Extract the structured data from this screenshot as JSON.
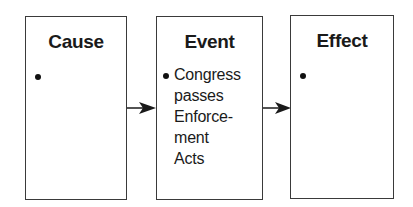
{
  "diagram": {
    "type": "cause-effect-chain",
    "boxes": [
      {
        "title": "Cause",
        "bullets": [
          ""
        ]
      },
      {
        "title": "Event",
        "bullets": [
          "Congress passes Enforce- ment Acts"
        ],
        "lines": [
          "Congress",
          "passes",
          "Enforce-",
          "ment",
          "Acts"
        ]
      },
      {
        "title": "Effect",
        "bullets": [
          ""
        ]
      }
    ],
    "arrows": [
      {
        "from": "Cause",
        "to": "Event"
      },
      {
        "from": "Event",
        "to": "Effect"
      }
    ],
    "colors": {
      "border": "#3a3a3a",
      "text": "#1a1a1a",
      "background": "#ffffff"
    }
  }
}
